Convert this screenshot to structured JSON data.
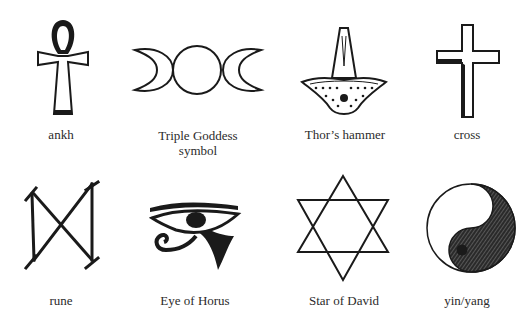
{
  "symbols": [
    {
      "id": "ankh",
      "label": "ankh"
    },
    {
      "id": "triple-goddess",
      "label_line1": "Triple Goddess",
      "label_line2": "symbol"
    },
    {
      "id": "thors-hammer",
      "label": "Thor’s hammer"
    },
    {
      "id": "cross",
      "label": "cross"
    },
    {
      "id": "rune",
      "label": "rune"
    },
    {
      "id": "eye-of-horus",
      "label": "Eye of Horus"
    },
    {
      "id": "star-of-david",
      "label": "Star of David"
    },
    {
      "id": "yin-yang",
      "label": "yin/yang"
    }
  ],
  "colors": {
    "ink": "#1a1a1a",
    "background": "#ffffff"
  }
}
